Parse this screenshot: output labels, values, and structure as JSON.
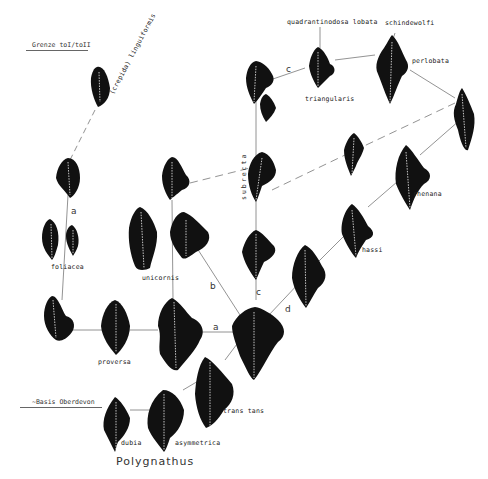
{
  "diagram": {
    "title": "Polygnathus",
    "horizons": {
      "top": "Grenze toI/toII",
      "bottom": "~Basis Oberdevon"
    },
    "species_labels": {
      "crepida_linguiformis": "(crepida) linguiformis",
      "quadrantinodosa_lobata": "quadrantinodosa lobata",
      "schindewolfi": "schindewolfi",
      "triangularis": "triangularis",
      "perlobata": "perlobata",
      "subrecta": "subrecta",
      "rhenana": "rhenana",
      "hassi": "hassi",
      "foliacea": "foliacea",
      "unicornis": "unicornis",
      "proversa": "proversa",
      "transitans": "trans tans",
      "dubia": "dubia",
      "asymmetrica": "asymmetrica"
    },
    "lineage_letters": {
      "a_left": "a",
      "a_bottom": "a",
      "b": "b",
      "c_top": "c",
      "c_mid": "c",
      "d": "d"
    },
    "colors": {
      "background": "#ffffff",
      "specimen": "#111111",
      "line": "#777777",
      "text": "#222222"
    }
  }
}
